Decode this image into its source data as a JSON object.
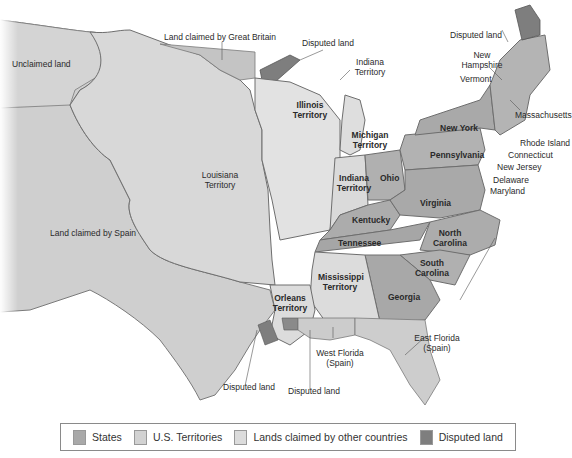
{
  "colors": {
    "background": "#ffffff",
    "states": "#a9a9a9",
    "territories": "#d2d2d2",
    "other_countries": "#cfcfcf",
    "disputed": "#7e7e7e",
    "border": "#6e6e6e",
    "text": "#2a2a2a"
  },
  "labels": {
    "unclaimed_land": "Unclaimed land",
    "land_claimed_great_britain": "Land claimed by Great Britain",
    "disputed_land_north": "Disputed land",
    "indiana_territory_north": "Indiana Territory",
    "disputed_land_ne": "Disputed land",
    "new_hampshire": "New Hampshire",
    "vermont": "Vermont",
    "massachusetts": "Massachusetts",
    "rhode_island": "Rhode Island",
    "connecticut": "Connecticut",
    "new_jersey": "New Jersey",
    "delaware": "Delaware",
    "maryland": "Maryland",
    "new_york": "New York",
    "pennsylvania": "Pennsylvania",
    "illinois_territory": "Illinois Territory",
    "michigan_territory": "Michigan Territory",
    "louisiana_territory": "Louisiana Territory",
    "indiana_territory": "Indiana Territory",
    "ohio": "Ohio",
    "virginia": "Virginia",
    "kentucky": "Kentucky",
    "north_carolina": "North Carolina",
    "tennessee": "Tennessee",
    "south_carolina": "South Carolina",
    "land_claimed_spain": "Land claimed by Spain",
    "mississippi_territory": "Mississippi Territory",
    "georgia": "Georgia",
    "orleans_territory": "Orleans Territory",
    "east_florida": "East Florida (Spain)",
    "west_florida": "West Florida (Spain)",
    "disputed_land_sw": "Disputed land",
    "disputed_land_s": "Disputed land"
  },
  "legend": {
    "items": [
      {
        "label": "States",
        "color": "#a9a9a9"
      },
      {
        "label": "U.S. Territories",
        "color": "#d2d2d2"
      },
      {
        "label": "Lands claimed by other countries",
        "color": "#d9d9d9"
      },
      {
        "label": "Disputed land",
        "color": "#7e7e7e"
      }
    ]
  }
}
